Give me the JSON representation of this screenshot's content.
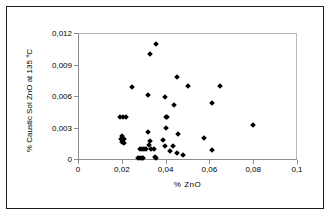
{
  "chart_data": {
    "type": "scatter",
    "title": "",
    "xlabel": "%  ZnO",
    "ylabel": "% Caustic Sol ZnO at 135 °C",
    "xlim": [
      0,
      0.1
    ],
    "ylim": [
      0,
      0.012
    ],
    "x_ticks": [
      "0",
      "0,02",
      "0,04",
      "0,06",
      "0,08",
      "0,1"
    ],
    "x_tick_values": [
      0,
      0.02,
      0.04,
      0.06,
      0.08,
      0.1
    ],
    "y_ticks": [
      "0",
      "0,003",
      "0,006",
      "0,009",
      "0,012"
    ],
    "y_tick_values": [
      0,
      0.003,
      0.006,
      0.009,
      0.012
    ],
    "grid": false,
    "legend": null,
    "marker": "diamond",
    "marker_color": "#000000",
    "series": [
      {
        "name": "Caustic Soluble ZnO vs ZnO",
        "points": [
          [
            0.0355,
            0.011
          ],
          [
            0.033,
            0.01
          ],
          [
            0.045,
            0.0078
          ],
          [
            0.0245,
            0.0069
          ],
          [
            0.065,
            0.007
          ],
          [
            0.05,
            0.007
          ],
          [
            0.032,
            0.0061
          ],
          [
            0.0395,
            0.0059
          ],
          [
            0.061,
            0.0053
          ],
          [
            0.044,
            0.0051
          ],
          [
            0.0192,
            0.004
          ],
          [
            0.0205,
            0.004
          ],
          [
            0.0218,
            0.004
          ],
          [
            0.04,
            0.004
          ],
          [
            0.0405,
            0.004
          ],
          [
            0.08,
            0.0032
          ],
          [
            0.04,
            0.003
          ],
          [
            0.0318,
            0.0026
          ],
          [
            0.0455,
            0.0024
          ],
          [
            0.02,
            0.0022
          ],
          [
            0.0195,
            0.0019
          ],
          [
            0.021,
            0.0019
          ],
          [
            0.0575,
            0.002
          ],
          [
            0.039,
            0.0018
          ],
          [
            0.02,
            0.0016
          ],
          [
            0.0212,
            0.0015
          ],
          [
            0.0328,
            0.0017
          ],
          [
            0.0325,
            0.0013
          ],
          [
            0.0395,
            0.0012
          ],
          [
            0.0435,
            0.0012
          ],
          [
            0.0612,
            0.0009
          ],
          [
            0.0282,
            0.001
          ],
          [
            0.0292,
            0.001
          ],
          [
            0.0302,
            0.001
          ],
          [
            0.0312,
            0.001
          ],
          [
            0.0335,
            0.001
          ],
          [
            0.0345,
            0.001
          ],
          [
            0.042,
            0.0008
          ],
          [
            0.045,
            0.0006
          ],
          [
            0.0478,
            0.0004
          ],
          [
            0.0275,
            0.0001
          ],
          [
            0.0283,
            0.0001
          ],
          [
            0.0291,
            0.0001
          ],
          [
            0.0299,
            0.0001
          ],
          [
            0.0352,
            0.0002
          ],
          [
            0.0355,
            0.0001
          ]
        ]
      }
    ]
  }
}
